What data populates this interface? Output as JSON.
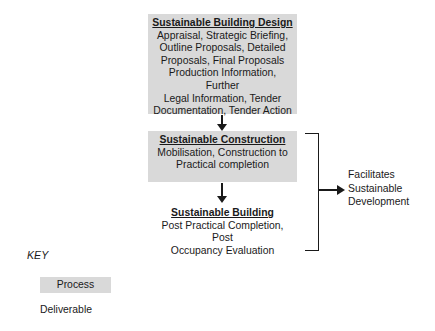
{
  "diagram": {
    "stages": [
      {
        "id": "sustainable-building-design",
        "kind": "process",
        "title": "Sustainable Building Design",
        "body": "Appraisal, Strategic Briefing,\nOutline Proposals, Detailed\nProposals, Final Proposals\nProduction Information, Further\nLegal Information, Tender\nDocumentation, Tender Action"
      },
      {
        "id": "sustainable-construction",
        "kind": "process",
        "title": "Sustainable Construction",
        "body": "Mobilisation, Construction to\nPractical completion"
      },
      {
        "id": "sustainable-building",
        "kind": "deliverable",
        "title": "Sustainable Building",
        "body": "Post Practical Completion, Post\nOccupancy Evaluation"
      }
    ],
    "outcome": "Facilitates\nSustainable\nDevelopment"
  },
  "key": {
    "title": "KEY",
    "process_label": "Process",
    "deliverable_label": "Deliverable"
  },
  "colors": {
    "process_fill": "#d9d9d9",
    "text": "#1a1a1a",
    "line": "#1a1a1a",
    "background": "#ffffff"
  }
}
